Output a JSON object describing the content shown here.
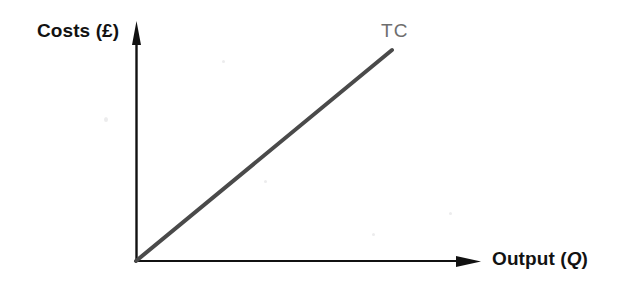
{
  "chart_data": {
    "type": "line",
    "title": "",
    "subtitle": "",
    "xlabel": "Output (Q)",
    "xlabel_text": "Output (",
    "xlabel_symbol": "Q",
    "xlabel_tail": ")",
    "ylabel": "Costs (£)",
    "xlim": [
      0,
      100
    ],
    "ylim": [
      0,
      100
    ],
    "grid": false,
    "legend_position": "inline-end-of-line",
    "x_tick_labels": [],
    "y_tick_labels": [],
    "axis_arrows": true,
    "annotations": [
      {
        "name": "tc-series-label",
        "text": "TC",
        "x": 88,
        "y": 100,
        "color": "#6e6e6e"
      }
    ],
    "series": [
      {
        "name": "TC",
        "label": "TC",
        "description": "Total cost: straight line from the origin, constant positive slope",
        "color": "#4a4a4a",
        "line_width_px": 4,
        "x": [
          0,
          100
        ],
        "values": [
          0,
          100
        ],
        "passes_through_origin": true,
        "slope": 1.0,
        "intercept": 0
      }
    ],
    "colors": {
      "background": "#ffffff",
      "axis": "#111111",
      "tc_line": "#4a4a4a",
      "tc_label": "#6e6e6e",
      "axis_label_text": "#121212"
    }
  },
  "figure": {
    "axes": {
      "y_axis_name": "costs-axis",
      "x_axis_name": "output-axis"
    }
  }
}
